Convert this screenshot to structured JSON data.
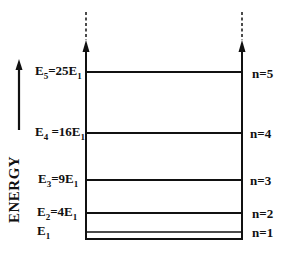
{
  "diagram": {
    "axis_label": "ENERGY",
    "levels": [
      {
        "n_label": "n=5",
        "energy_label": "E",
        "sub": "5",
        "eq": "=25E",
        "eq_sub": "1",
        "y": 72
      },
      {
        "n_label": "n=4",
        "energy_label": "E",
        "sub": "4",
        "eq": " =16E",
        "eq_sub": "1",
        "y": 133
      },
      {
        "n_label": "n=3",
        "energy_label": "E",
        "sub": "3",
        "eq": "=9E",
        "eq_sub": "1",
        "y": 180
      },
      {
        "n_label": "n=2",
        "energy_label": "E",
        "sub": "2",
        "eq": "=4E",
        "eq_sub": "1",
        "y": 213
      },
      {
        "n_label": "n=1",
        "energy_label": "E",
        "sub": "1",
        "eq": "",
        "eq_sub": "",
        "y": 232
      }
    ],
    "colors": {
      "line": "#111111",
      "background": "#ffffff"
    }
  }
}
